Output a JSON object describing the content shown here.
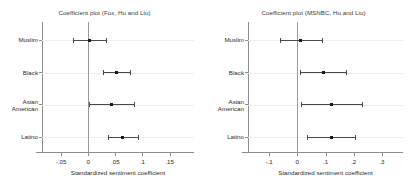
{
  "chart_data": [
    {
      "type": "scatter",
      "panel": "left",
      "title": "Coefficient plot (Fox, Hu and Liu)",
      "xlabel": "Standardized sentiment coefficient",
      "ylabel": "",
      "xlim": [
        -0.085,
        0.195
      ],
      "xticks": [
        -0.05,
        0,
        0.05,
        0.1,
        0.15
      ],
      "xticklabels": [
        "-.05",
        "0",
        ".05",
        ".1",
        ".15"
      ],
      "categories": [
        "Muslim",
        "Black",
        "Asian American",
        "Latino"
      ],
      "grid": true,
      "legend": "none",
      "zero_reference_line": 0,
      "points": [
        {
          "category": "Muslim",
          "estimate": 0.002,
          "ci_low": -0.028,
          "ci_high": 0.032
        },
        {
          "category": "Black",
          "estimate": 0.052,
          "ci_low": 0.027,
          "ci_high": 0.078
        },
        {
          "category": "Asian American",
          "estimate": 0.043,
          "ci_low": 0.001,
          "ci_high": 0.085
        },
        {
          "category": "Latino",
          "estimate": 0.063,
          "ci_low": 0.036,
          "ci_high": 0.091
        }
      ]
    },
    {
      "type": "scatter",
      "panel": "right",
      "title": "Coefficient plot (MSNBC, Hu and Liu)",
      "xlabel": "Standardized sentiment coefficient",
      "ylabel": "",
      "xlim": [
        -0.175,
        0.375
      ],
      "xticks": [
        -0.1,
        0,
        0.1,
        0.2,
        0.3
      ],
      "xticklabels": [
        "-.1",
        "0",
        ".1",
        ".2",
        ".3"
      ],
      "categories": [
        "Muslim",
        "Black",
        "Asian American",
        "Latino"
      ],
      "grid": true,
      "legend": "none",
      "zero_reference_line": 0,
      "points": [
        {
          "category": "Muslim",
          "estimate": 0.012,
          "ci_low": -0.062,
          "ci_high": 0.086
        },
        {
          "category": "Black",
          "estimate": 0.092,
          "ci_low": 0.008,
          "ci_high": 0.172
        },
        {
          "category": "Asian American",
          "estimate": 0.122,
          "ci_low": 0.012,
          "ci_high": 0.228
        },
        {
          "category": "Latino",
          "estimate": 0.122,
          "ci_low": 0.035,
          "ci_high": 0.205
        }
      ]
    }
  ]
}
